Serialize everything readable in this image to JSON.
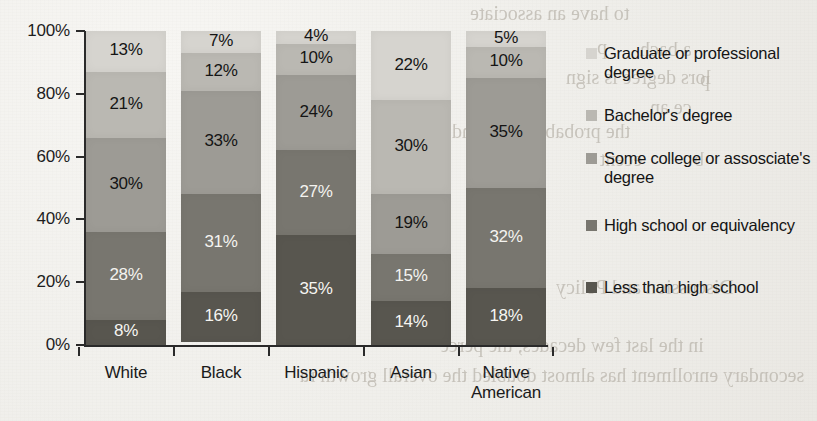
{
  "chart_data": {
    "type": "bar",
    "subtype": "stacked-bar-100-percent",
    "orientation": "vertical",
    "title": "",
    "xlabel": "",
    "ylabel": "",
    "ylim": [
      0,
      100
    ],
    "ytick_labels": [
      "100%",
      "80%",
      "60%",
      "40%",
      "20%",
      "0%"
    ],
    "ytick_values": [
      100,
      80,
      60,
      40,
      20,
      0
    ],
    "grid": false,
    "legend_position": "right",
    "categories": [
      "White",
      "Black",
      "Hispanic",
      "Asian",
      "Native American"
    ],
    "series": [
      {
        "name": "Graduate or professional degree",
        "color": "#d6d4cf",
        "label_color": "#151515",
        "values": [
          13,
          7,
          4,
          22,
          5
        ],
        "value_labels": [
          "13%",
          "7%",
          "4%",
          "22%",
          "5%"
        ]
      },
      {
        "name": "Bachelor's degree",
        "color": "#bab8b2",
        "label_color": "#151515",
        "values": [
          21,
          12,
          10,
          30,
          10
        ],
        "value_labels": [
          "21%",
          "12%",
          "10%",
          "30%",
          "10%"
        ]
      },
      {
        "name": "Some college or assosciate's degree",
        "color": "#9d9b95",
        "label_color": "#141414",
        "values": [
          30,
          33,
          24,
          19,
          35
        ],
        "value_labels": [
          "30%",
          "33%",
          "24%",
          "19%",
          "35%"
        ]
      },
      {
        "name": "High school or equivalency",
        "color": "#78766f",
        "label_color": "#f4f3f0",
        "values": [
          28,
          31,
          27,
          15,
          32
        ],
        "value_labels": [
          "28%",
          "31%",
          "27%",
          "15%",
          "32%"
        ]
      },
      {
        "name": "Less than high school",
        "color": "#58564f",
        "label_color": "#f6f5f2",
        "values": [
          8,
          16,
          35,
          14,
          18
        ],
        "value_labels": [
          "8%",
          "16%",
          "35%",
          "14%",
          "18%"
        ]
      }
    ]
  },
  "legend": {
    "entries": [
      {
        "label": "Graduate or professional degree",
        "color": "#d6d4cf"
      },
      {
        "label": "Bachelor's degree",
        "color": "#bab8b2"
      },
      {
        "label": "Some college or assosciate's degree",
        "color": "#9d9b95"
      },
      {
        "label": "High school or equivalency",
        "color": "#78766f"
      },
      {
        "label": "Less than high school",
        "color": "#58564f"
      }
    ]
  },
  "page_bleed": {
    "lines": [
      {
        "text": "to have an associate",
        "x": 470,
        "y": 2,
        "size": 20
      },
      {
        "text": "p",
        "x": 597,
        "y": 36,
        "size": 20
      },
      {
        "text": "a bach",
        "x": 640,
        "y": 38,
        "size": 20
      },
      {
        "text": "lors degree is sign",
        "x": 566,
        "y": 66,
        "size": 20
      },
      {
        "text": "p",
        "x": 700,
        "y": 68,
        "size": 20
      },
      {
        "text": "ce an",
        "x": 650,
        "y": 96,
        "size": 20
      },
      {
        "text": "the probability of land",
        "x": 452,
        "y": 120,
        "size": 20
      },
      {
        "text": "ecent",
        "x": 600,
        "y": 148,
        "size": 20
      },
      {
        "text": "b",
        "x": 694,
        "y": 148,
        "size": 20
      },
      {
        "text": "Discussion and Policy",
        "x": 556,
        "y": 276,
        "size": 20
      },
      {
        "text": "in the last few decades, the perce",
        "x": 440,
        "y": 334,
        "size": 20
      },
      {
        "text": "secondary enrollment has almost doubled the overall growth ra",
        "x": 300,
        "y": 364,
        "size": 20
      }
    ]
  }
}
